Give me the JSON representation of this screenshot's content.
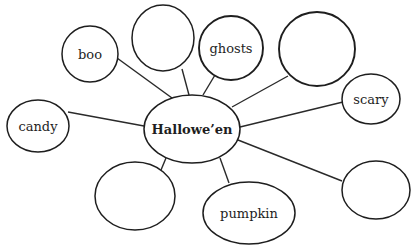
{
  "diagram": {
    "type": "word-web",
    "center": {
      "id": "halloween",
      "label": "Hallowe’en",
      "cx": 192,
      "cy": 129,
      "rx": 48,
      "ry": 34
    },
    "nodes": [
      {
        "id": "boo",
        "label": "boo",
        "cx": 90,
        "cy": 54,
        "rx": 28,
        "ry": 28,
        "line": [
          117,
          58,
          172,
          98
        ]
      },
      {
        "id": "top-blank",
        "label": "",
        "cx": 163,
        "cy": 38,
        "rx": 31,
        "ry": 33,
        "line": [
          182,
          69,
          189,
          95
        ]
      },
      {
        "id": "ghosts",
        "label": "ghosts",
        "cx": 231,
        "cy": 48,
        "rx": 32,
        "ry": 32,
        "line": [
          215,
          75,
          203,
          95
        ]
      },
      {
        "id": "upper-right-blank",
        "label": "",
        "cx": 317,
        "cy": 49,
        "rx": 38,
        "ry": 37,
        "line": [
          288,
          76,
          232,
          107
        ]
      },
      {
        "id": "scary",
        "label": "scary",
        "cx": 371,
        "cy": 99,
        "rx": 29,
        "ry": 25,
        "line": [
          343,
          102,
          240,
          127
        ]
      },
      {
        "id": "lower-right-blank",
        "label": "",
        "cx": 376,
        "cy": 190,
        "rx": 34,
        "ry": 29,
        "line": [
          342,
          181,
          238,
          140
        ]
      },
      {
        "id": "pumpkin",
        "label": "pumpkin",
        "cx": 249,
        "cy": 213,
        "rx": 46,
        "ry": 31,
        "line": [
          229,
          183,
          220,
          158
        ]
      },
      {
        "id": "lower-left-blank",
        "label": "",
        "cx": 135,
        "cy": 196,
        "rx": 40,
        "ry": 34,
        "line": [
          161,
          170,
          166,
          158
        ]
      },
      {
        "id": "candy",
        "label": "candy",
        "cx": 38,
        "cy": 126,
        "rx": 31,
        "ry": 26,
        "line": [
          68,
          112,
          144,
          126
        ]
      }
    ]
  }
}
